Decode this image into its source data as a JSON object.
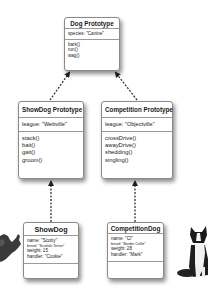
{
  "colors": {
    "border": "#8a8a8a",
    "arrow": "#222222",
    "background": "#ffffff"
  },
  "dog_prototype": {
    "title": "Dog Prototype",
    "properties": [
      "species: \"Canine\""
    ],
    "methods": [
      "bark()",
      "run()",
      "wag()"
    ]
  },
  "showdog_prototype": {
    "title": "ShowDog Prototype",
    "properties": [
      "league: \"Webville\""
    ],
    "methods": [
      "stack()",
      "bait()",
      "gait()",
      "groom()"
    ]
  },
  "competition_prototype": {
    "title": "Competition Prototype",
    "properties": [
      "league: \"Objectville\""
    ],
    "methods": [
      "crossDrive()",
      "awayDrive()",
      "shedding()",
      "singling()"
    ]
  },
  "showdog": {
    "title": "ShowDog",
    "name": "name: \"Scotty\"",
    "breed": "breed: \"Scottish Terrier\"",
    "weight": "weight: 15",
    "handler": "handler: \"Cookie\""
  },
  "competitiondog": {
    "title": "CompetitionDog",
    "name": "name: \"CI\"",
    "breed": "breed: \"Border Collie\"",
    "weight": "weight: 28",
    "handler": "handler: \"Mark\""
  },
  "images": {
    "left": "scottish-terrier-photo",
    "right": "border-collie-photo"
  }
}
